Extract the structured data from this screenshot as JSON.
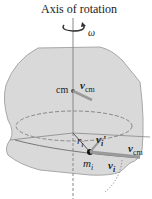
{
  "title": "Axis of rotation",
  "labels": {
    "omega": "ω",
    "cm": "cm",
    "v_cm_top": "v",
    "v_cm_top_sub": "cm",
    "r_i": "r",
    "r_i_sub": "i",
    "v_i_prime": "v",
    "v_i_prime_sub": "i",
    "v_i_prime_mark": "′",
    "v_cm_right": "v",
    "v_cm_right_sub": "cm",
    "m_i": "m",
    "m_i_sub": "i",
    "v_i": "v",
    "v_i_sub": "i"
  },
  "colors": {
    "body_fill": "#d9d9d9",
    "body_stroke": "#a8a8a8",
    "axis": "#888888",
    "arrow": "#9a9a9a",
    "text": "#222222"
  }
}
